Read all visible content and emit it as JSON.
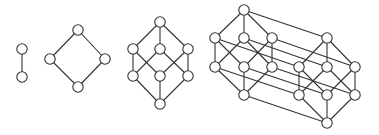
{
  "diagram": {
    "colors": {
      "stroke": "#333333",
      "node_fill": "#ffffff",
      "background": "#ffffff"
    },
    "node_radius": 5.2,
    "graphs": [
      {
        "name": "1-cube",
        "nodes": [
          [
            22,
            49
          ],
          [
            22,
            77
          ]
        ],
        "edges": [
          [
            0,
            1
          ]
        ]
      },
      {
        "name": "2-cube",
        "nodes": [
          [
            78,
            30
          ],
          [
            50,
            59
          ],
          [
            105,
            59
          ],
          [
            78,
            87
          ]
        ],
        "edges": [
          [
            0,
            1
          ],
          [
            0,
            2
          ],
          [
            1,
            3
          ],
          [
            2,
            3
          ]
        ]
      },
      {
        "name": "3-cube",
        "nodes": [
          [
            160,
            22
          ],
          [
            133,
            49
          ],
          [
            160,
            49
          ],
          [
            188,
            49
          ],
          [
            133,
            76
          ],
          [
            160,
            76
          ],
          [
            188,
            76
          ],
          [
            160,
            104
          ]
        ],
        "edges": [
          [
            0,
            1
          ],
          [
            0,
            2
          ],
          [
            0,
            3
          ],
          [
            1,
            4
          ],
          [
            1,
            5
          ],
          [
            2,
            4
          ],
          [
            2,
            6
          ],
          [
            3,
            5
          ],
          [
            3,
            6
          ],
          [
            4,
            7
          ],
          [
            5,
            7
          ],
          [
            6,
            7
          ]
        ]
      },
      {
        "name": "4-cube",
        "nodes": [
          [
            244,
            10
          ],
          [
            215,
            38
          ],
          [
            244,
            38
          ],
          [
            272,
            38
          ],
          [
            215,
            67
          ],
          [
            244,
            67
          ],
          [
            272,
            67
          ],
          [
            244,
            95
          ],
          [
            327,
            38
          ],
          [
            299,
            67
          ],
          [
            327,
            67
          ],
          [
            355,
            67
          ],
          [
            299,
            95
          ],
          [
            327,
            95
          ],
          [
            355,
            95
          ],
          [
            327,
            123
          ]
        ],
        "edges": [
          [
            0,
            1
          ],
          [
            0,
            2
          ],
          [
            0,
            3
          ],
          [
            1,
            4
          ],
          [
            1,
            5
          ],
          [
            2,
            4
          ],
          [
            2,
            6
          ],
          [
            3,
            5
          ],
          [
            3,
            6
          ],
          [
            4,
            7
          ],
          [
            5,
            7
          ],
          [
            6,
            7
          ],
          [
            8,
            9
          ],
          [
            8,
            10
          ],
          [
            8,
            11
          ],
          [
            9,
            12
          ],
          [
            9,
            13
          ],
          [
            10,
            12
          ],
          [
            10,
            14
          ],
          [
            11,
            13
          ],
          [
            11,
            14
          ],
          [
            12,
            15
          ],
          [
            13,
            15
          ],
          [
            14,
            15
          ],
          [
            0,
            8
          ],
          [
            1,
            9
          ],
          [
            2,
            10
          ],
          [
            3,
            11
          ],
          [
            4,
            12
          ],
          [
            5,
            13
          ],
          [
            6,
            14
          ],
          [
            7,
            15
          ]
        ]
      }
    ]
  }
}
